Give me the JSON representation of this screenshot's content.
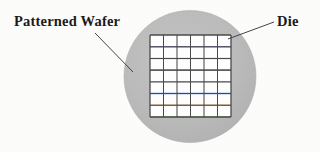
{
  "figure": {
    "background_color": "#fdfdfb",
    "labels": {
      "patterned_wafer": "Patterned Wafer",
      "die": "Die"
    },
    "wafer": {
      "name": "patterned-wafer-disc",
      "shape": "circle",
      "center_x": 190,
      "center_y": 76.5,
      "radius": 66,
      "fill_color": "#b9b9b9",
      "edge_color": "#b0b0b0"
    },
    "die_grid": {
      "name": "die-array",
      "columns": 6,
      "rows": 7,
      "x": 150,
      "y": 35,
      "width": 81,
      "height": 82,
      "cell_fill": "#ffffff",
      "line_color": "#4a4a4a",
      "line_width": 1.1,
      "accent_lines": [
        {
          "row_index": 1,
          "color": "#7b74c8",
          "label": "violet-accent"
        },
        {
          "row_index": 2,
          "color": "#c9c24a",
          "label": "olive-accent"
        },
        {
          "row_index": 3,
          "color": "#8a8a8a",
          "label": "gray-accent"
        },
        {
          "row_index": 5,
          "color": "#4a6fc8",
          "label": "blue-accent"
        },
        {
          "row_index": 6,
          "color": "#c88a4a",
          "label": "orange-accent"
        },
        {
          "row_index": 7,
          "color": "#6fc464",
          "label": "green-accent"
        }
      ]
    },
    "leaders": [
      {
        "name": "leader-line-patterned-wafer",
        "x1": 95,
        "y1": 33,
        "x2": 133,
        "y2": 72,
        "color": "#3a3a3a"
      },
      {
        "name": "leader-line-die",
        "x1": 274,
        "y1": 22,
        "x2": 228,
        "y2": 39,
        "color": "#3a3a3a"
      }
    ]
  }
}
